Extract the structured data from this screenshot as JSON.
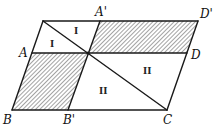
{
  "diagram": {
    "title": "",
    "colors": {
      "stroke": "#1a1a1a",
      "hatch": "#555555",
      "background": "#ffffff"
    },
    "points": {
      "P": {
        "x": 43,
        "y": 21
      },
      "A'": {
        "x": 100,
        "y": 21
      },
      "D'": {
        "x": 198,
        "y": 21
      },
      "A": {
        "x": 32,
        "y": 53
      },
      "O": {
        "x": 88,
        "y": 53
      },
      "D": {
        "x": 187,
        "y": 53
      },
      "B": {
        "x": 12,
        "y": 110
      },
      "B'": {
        "x": 68,
        "y": 110
      },
      "C": {
        "x": 167,
        "y": 110
      }
    },
    "labels": [
      {
        "text": "A'",
        "x": 95,
        "y": 16
      },
      {
        "text": "D'",
        "x": 200,
        "y": 18
      },
      {
        "text": "A",
        "x": 19,
        "y": 57
      },
      {
        "text": "D",
        "x": 191,
        "y": 59
      },
      {
        "text": "B",
        "x": 3,
        "y": 124
      },
      {
        "text": "B'",
        "x": 63,
        "y": 124
      },
      {
        "text": "C",
        "x": 163,
        "y": 124
      }
    ],
    "region_numerals": [
      {
        "text": "I",
        "x": 77,
        "y": 33
      },
      {
        "text": "I",
        "x": 52,
        "y": 46
      },
      {
        "text": "II",
        "x": 146,
        "y": 73
      },
      {
        "text": "II",
        "x": 102,
        "y": 95
      }
    ],
    "hatched_regions": [
      "A'-D'-D-O",
      "A-O-B'-B"
    ],
    "segments": [
      "P-D'",
      "A-D",
      "B-C",
      "B-P",
      "C-D'",
      "B'-A'",
      "P-C"
    ]
  }
}
